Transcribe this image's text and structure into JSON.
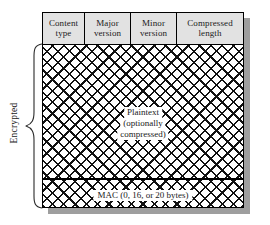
{
  "figure": {
    "background_color": "#ffffff",
    "line_color": "#000000",
    "header_fill": "#e2e2e2",
    "shadow_color": "#9e9e9e"
  },
  "header": {
    "fields": [
      {
        "line1": "Content",
        "line2": "type",
        "width_pct": 21
      },
      {
        "line1": "Major",
        "line2": "version",
        "width_pct": 23
      },
      {
        "line1": "Minor",
        "line2": "version",
        "width_pct": 23
      },
      {
        "line1": "Compressed",
        "line2": "length",
        "width_pct": 33
      }
    ]
  },
  "body": {
    "plaintext": {
      "line1": "Plaintext",
      "line2": "(optionally",
      "line3": "compressed)"
    },
    "mac": {
      "label": "MAC (0, 16, or 20 bytes)"
    },
    "fill": "cross-hatch"
  },
  "annotation": {
    "brace_label": "Encrypted"
  }
}
